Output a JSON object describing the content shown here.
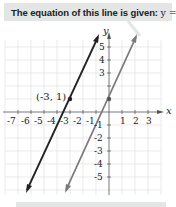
{
  "callout": {
    "prefix": "The equation of this line is given: ",
    "equation": "y = 2x + 1."
  },
  "graph": {
    "x_axis_label": "x",
    "y_axis_label": "y",
    "x_ticks": [
      "-7",
      "-6",
      "-5",
      "-4",
      "-3",
      "-2",
      "-1",
      "1",
      "2",
      "3"
    ],
    "y_ticks_pos": [
      "5",
      "4",
      "3"
    ],
    "y_ticks_neg": [
      "-1",
      "-2",
      "-3",
      "-4",
      "-5"
    ],
    "point_label": "(-3, 1)",
    "lines": [
      {
        "name": "y = 2x + 7",
        "color": "#222222"
      },
      {
        "name": "y = 2x + 1",
        "color": "#7a7a7a"
      }
    ],
    "points": [
      {
        "x": -3,
        "y": 1
      },
      {
        "x": 0,
        "y": 1
      }
    ]
  }
}
